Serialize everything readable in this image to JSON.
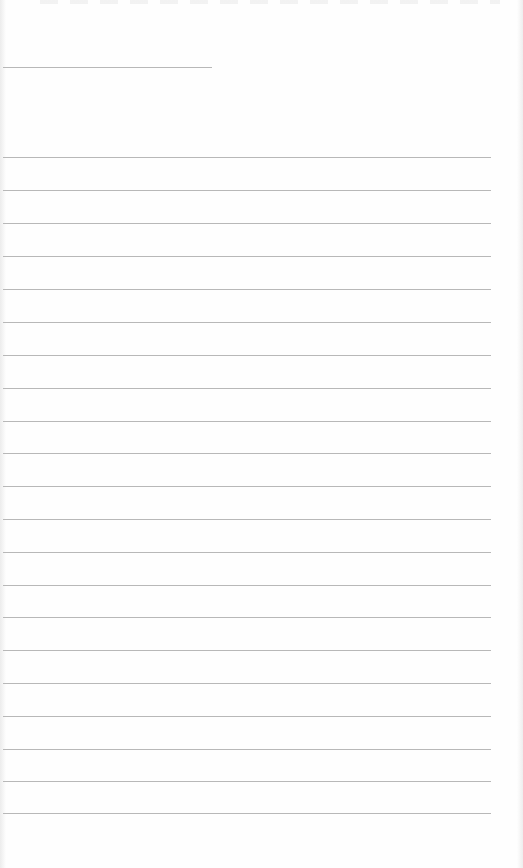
{
  "document": {
    "type": "lined-paper",
    "background_color": "#fefefe",
    "line_color": "#b8b8b8",
    "header_line": {
      "x_start": 3,
      "x_end": 212,
      "y": 67
    },
    "ruled_lines": {
      "count": 21,
      "x_start": 3,
      "x_end": 491,
      "y_positions": [
        157,
        190,
        223,
        256,
        289,
        322,
        355,
        388,
        421,
        453,
        486,
        519,
        552,
        585,
        617,
        650,
        683,
        716,
        749,
        781,
        813
      ]
    },
    "text_content": []
  }
}
